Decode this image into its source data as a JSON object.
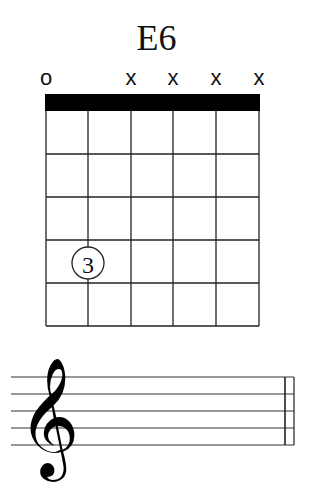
{
  "chord": {
    "name": "E6",
    "string_markers": [
      "o",
      "",
      "x",
      "x",
      "x",
      "x"
    ],
    "frets_shown": 5,
    "strings": 6,
    "fingering": [
      {
        "string": 2,
        "fret": 4,
        "finger": "3"
      }
    ]
  },
  "staff": {
    "clef": "treble-clef",
    "lines": 5,
    "barline": "double"
  }
}
